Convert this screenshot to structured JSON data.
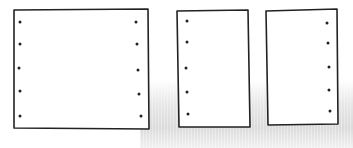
{
  "diagram": {
    "stroke_color": "#222222",
    "fill_color": "#ffffff",
    "background_texture_color": "#d8d8d8",
    "shapes": [
      {
        "name": "wide-sheet",
        "points": [
          [
            14,
            10
          ],
          [
            148,
            9
          ],
          [
            149,
            129
          ],
          [
            14,
            128
          ]
        ],
        "dots": [
          [
            20,
            22
          ],
          [
            20,
            44
          ],
          [
            19,
            68
          ],
          [
            20,
            91
          ],
          [
            20,
            116
          ],
          [
            136,
            22
          ],
          [
            137,
            44
          ],
          [
            138,
            70
          ],
          [
            139,
            94
          ],
          [
            141,
            116
          ]
        ]
      },
      {
        "name": "narrow-sheet-left-holes",
        "points": [
          [
            177,
            11
          ],
          [
            248,
            10
          ],
          [
            250,
            127
          ],
          [
            179,
            127
          ]
        ],
        "dots": [
          [
            187,
            21
          ],
          [
            187,
            42
          ],
          [
            186,
            68
          ],
          [
            187,
            92
          ],
          [
            188,
            114
          ]
        ]
      },
      {
        "name": "narrow-sheet-right-holes",
        "points": [
          [
            266,
            11
          ],
          [
            337,
            9
          ],
          [
            338,
            124
          ],
          [
            268,
            125
          ]
        ],
        "dots": [
          [
            327,
            23
          ],
          [
            328,
            43
          ],
          [
            329,
            67
          ],
          [
            329,
            90
          ],
          [
            330,
            111
          ]
        ]
      }
    ]
  }
}
